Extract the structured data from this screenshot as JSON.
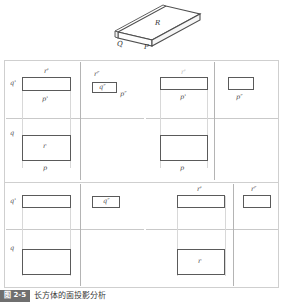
{
  "figure": {
    "pictorial": {
      "name": "rectangular-prism-pictorial",
      "face_top": "R",
      "face_left": "Q",
      "face_front": "P"
    },
    "panels": [
      {
        "id": "top-left",
        "labels": {
          "front_top": "r'",
          "front_left": "q'",
          "front_bottom": "p'",
          "top_left": "q",
          "top_inside": "r",
          "top_bottom": "p",
          "side_top": "r″",
          "side_inside": "q″",
          "side_right": "p″"
        }
      },
      {
        "id": "top-right",
        "labels": {
          "front_top": "r'",
          "front_bottom": "p'",
          "top_bottom": "p",
          "side_right": "p″"
        }
      },
      {
        "id": "bottom-left",
        "labels": {
          "front_left": "q'",
          "top_left": "q",
          "side_inside": "q″"
        }
      },
      {
        "id": "bottom-right",
        "labels": {
          "front_top": "r'",
          "top_inside": "r",
          "side_top": "r″"
        }
      }
    ]
  },
  "caption": {
    "badge": "图 2-5",
    "text": "长方体的面投影分析"
  }
}
